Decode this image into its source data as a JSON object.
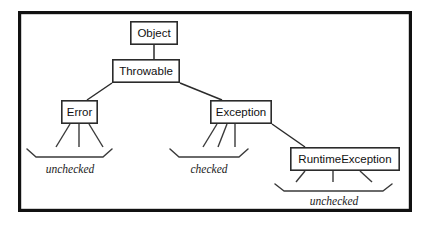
{
  "diagram": {
    "type": "class-hierarchy",
    "frame": {
      "x": 18,
      "y": 11,
      "width": 394,
      "height": 201,
      "border_color": "#111111",
      "background": "#ffffff"
    },
    "nodes": [
      {
        "id": "object",
        "label": "Object",
        "x": 130,
        "y": 21,
        "width": 48,
        "height": 24
      },
      {
        "id": "throwable",
        "label": "Throwable",
        "x": 112,
        "y": 59,
        "width": 68,
        "height": 24
      },
      {
        "id": "error",
        "label": "Error",
        "x": 61,
        "y": 100,
        "width": 37,
        "height": 24
      },
      {
        "id": "exception",
        "label": "Exception",
        "x": 210,
        "y": 100,
        "width": 62,
        "height": 24
      },
      {
        "id": "runtimeexception",
        "label": "RuntimeException",
        "x": 290,
        "y": 147,
        "width": 110,
        "height": 24
      }
    ],
    "edges": [
      {
        "id": "object-throwable",
        "from": "object",
        "to": "throwable",
        "x1": 154,
        "y1": 45,
        "x2": 154,
        "y2": 59
      },
      {
        "id": "throwable-error",
        "from": "throwable",
        "to": "error",
        "x1": 112,
        "y1": 83,
        "x2": 87,
        "y2": 100
      },
      {
        "id": "throwable-exception",
        "from": "throwable",
        "to": "exception",
        "x1": 180,
        "y1": 83,
        "x2": 222,
        "y2": 100
      },
      {
        "id": "exception-runtimeexception",
        "from": "exception",
        "to": "runtimeexception",
        "x1": 272,
        "y1": 124,
        "x2": 305,
        "y2": 147
      }
    ],
    "subclass_stubs": [
      {
        "id": "error-stub-left",
        "parent": "error",
        "x1": 70,
        "y1": 124,
        "x2": 56,
        "y2": 147
      },
      {
        "id": "error-stub-middle",
        "parent": "error",
        "x1": 79,
        "y1": 124,
        "x2": 79,
        "y2": 147
      },
      {
        "id": "error-stub-right",
        "parent": "error",
        "x1": 89,
        "y1": 124,
        "x2": 103,
        "y2": 147
      },
      {
        "id": "exception-stub-left",
        "parent": "exception",
        "x1": 217,
        "y1": 124,
        "x2": 203,
        "y2": 147
      },
      {
        "id": "exception-stub-middle",
        "parent": "exception",
        "x1": 227,
        "y1": 124,
        "x2": 218,
        "y2": 147
      },
      {
        "id": "exception-stub-right",
        "parent": "exception",
        "x1": 235,
        "y1": 124,
        "x2": 235,
        "y2": 147
      },
      {
        "id": "runtime-stub-left",
        "parent": "runtimeexception",
        "x1": 305,
        "y1": 171,
        "x2": 296,
        "y2": 182
      },
      {
        "id": "runtime-stub-middle",
        "parent": "runtimeexception",
        "x1": 333,
        "y1": 171,
        "x2": 333,
        "y2": 182
      },
      {
        "id": "runtime-stub-right",
        "parent": "runtimeexception",
        "x1": 360,
        "y1": 171,
        "x2": 372,
        "y2": 182
      }
    ],
    "group_braces": [
      {
        "id": "error-group",
        "label": "unchecked",
        "for": "error",
        "brace": {
          "left": 27,
          "right": 112,
          "top": 149,
          "bottom": 157,
          "tip": 6
        },
        "label_x": 70,
        "label_y": 170
      },
      {
        "id": "exception-group",
        "label": "checked",
        "for": "exception",
        "brace": {
          "left": 170,
          "right": 248,
          "top": 149,
          "bottom": 157,
          "tip": 6
        },
        "label_x": 209,
        "label_y": 170
      },
      {
        "id": "runtimeexception-group",
        "label": "unchecked",
        "for": "runtimeexception",
        "brace": {
          "left": 275,
          "right": 392,
          "top": 184,
          "bottom": 191,
          "tip": 6
        },
        "label_x": 334,
        "label_y": 202
      }
    ]
  }
}
